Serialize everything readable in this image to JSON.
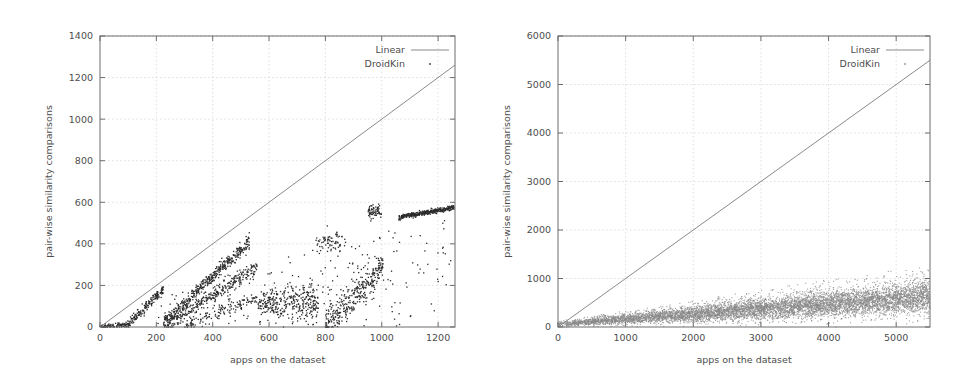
{
  "figure": {
    "name": "droidkin-scalability-figure",
    "background": "#ffffff",
    "panel_count": 2
  },
  "chart_data": [
    {
      "panel": "left",
      "type": "scatter",
      "title": "",
      "xlabel": "apps on the dataset",
      "ylabel": "pair-wise similarity comparisons",
      "xlim": [
        0,
        1260
      ],
      "ylim": [
        0,
        1400
      ],
      "xticks": [
        0,
        200,
        400,
        600,
        800,
        1000,
        1200
      ],
      "xtick_labels": [
        "0",
        "200",
        "400",
        "600",
        "800",
        "1000",
        "1200"
      ],
      "yticks": [
        0,
        200,
        400,
        600,
        800,
        1000,
        1200,
        1400
      ],
      "ytick_labels": [
        "0",
        "200",
        "400",
        "600",
        "800",
        "1000",
        "1200",
        "1400"
      ],
      "grid": true,
      "legend_position": "top-right",
      "series": [
        {
          "name": "Linear",
          "marker": "line",
          "color": "#7d7d7d",
          "x": [
            0,
            1260
          ],
          "values": [
            0,
            1260
          ],
          "description": "y = x reference line from origin to upper-right"
        },
        {
          "name": "DroidKin",
          "marker": "point",
          "color": "#2b2b2b",
          "description": "scatter of measured comparisons; several rising diagonal streaks that saturate, plus a dense flat band near 540-580 for x above 1060",
          "x": [
            20,
            60,
            95,
            120,
            150,
            180,
            205,
            215,
            240,
            270,
            300,
            330,
            360,
            400,
            440,
            470,
            500,
            520,
            540,
            560,
            600,
            640,
            680,
            720,
            760,
            790,
            800,
            830,
            860,
            900,
            940,
            960,
            980,
            1000,
            1040,
            1070,
            1100,
            1140,
            1180,
            1220,
            1255
          ],
          "values": [
            8,
            12,
            18,
            45,
            70,
            95,
            140,
            175,
            110,
            150,
            200,
            250,
            300,
            340,
            380,
            400,
            415,
            430,
            300,
            120,
            115,
            105,
            95,
            85,
            130,
            410,
            420,
            430,
            150,
            190,
            230,
            300,
            560,
            545,
            300,
            530,
            540,
            550,
            560,
            565,
            575
          ]
        }
      ]
    },
    {
      "panel": "right",
      "type": "scatter",
      "title": "",
      "xlabel": "apps on the dataset",
      "ylabel": "pair-wise similarity comparisons",
      "xlim": [
        0,
        5500
      ],
      "ylim": [
        0,
        6000
      ],
      "xticks": [
        0,
        1000,
        2000,
        3000,
        4000,
        5000
      ],
      "xtick_labels": [
        "0",
        "1000",
        "2000",
        "3000",
        "4000",
        "5000"
      ],
      "yticks": [
        0,
        1000,
        2000,
        3000,
        4000,
        5000,
        6000
      ],
      "ytick_labels": [
        "0",
        "1000",
        "2000",
        "3000",
        "4000",
        "5000",
        "6000"
      ],
      "grid": true,
      "legend_position": "top-right",
      "series": [
        {
          "name": "Linear",
          "marker": "line",
          "color": "#7d7d7d",
          "x": [
            0,
            5500
          ],
          "values": [
            0,
            5500
          ],
          "description": "y = x reference line from origin to upper-right"
        },
        {
          "name": "DroidKin",
          "marker": "point",
          "color": "#8a8a8a",
          "description": "dense fan-shaped cloud of points spreading from the origin; upper envelope reaches about 1300 at x = 5500 while the bulk stays below 700",
          "x": [
            250,
            500,
            750,
            1000,
            1250,
            1500,
            1750,
            2000,
            2250,
            2500,
            2750,
            3000,
            3250,
            3500,
            3750,
            4000,
            4250,
            4500,
            4750,
            5000,
            5250,
            5500
          ],
          "values": [
            40,
            80,
            115,
            150,
            185,
            215,
            250,
            280,
            310,
            340,
            370,
            400,
            430,
            455,
            480,
            505,
            530,
            555,
            575,
            600,
            620,
            640
          ],
          "envelope_upper": [
            90,
            170,
            250,
            320,
            390,
            455,
            520,
            580,
            640,
            700,
            760,
            820,
            880,
            930,
            990,
            1040,
            1090,
            1140,
            1190,
            1240,
            1280,
            1320
          ]
        }
      ]
    }
  ],
  "panels": {
    "left": {
      "legend": {
        "linear_label": "Linear",
        "droidkin_label": "DroidKin"
      },
      "xlabel": "apps on the dataset",
      "ylabel": "pair-wise similarity comparisons"
    },
    "right": {
      "legend": {
        "linear_label": "Linear",
        "droidkin_label": "DroidKin"
      },
      "xlabel": "apps on the dataset",
      "ylabel": "pair-wise similarity comparisons"
    }
  },
  "colors": {
    "axis": "#6d6d6d",
    "grid": "#c9c9c9",
    "text": "#4d4d4d",
    "linear_series": "#7d7d7d",
    "points_left": "#2b2b2b",
    "points_right": "#8a8a8a",
    "background": "#ffffff"
  }
}
